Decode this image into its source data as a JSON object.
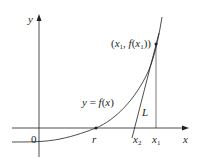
{
  "diagram": {
    "colors": {
      "ink": "#231f20",
      "background": "#ffffff"
    },
    "axes": {
      "x_label": "x",
      "y_label": "y",
      "origin_label": "0"
    },
    "curve_label": "y = f(x)",
    "tangent_label": "L",
    "point_label": "(x₁, f(x₁))",
    "point_label_parts": {
      "open": "(",
      "x": "x",
      "sub1": "1",
      "comma": ", ",
      "f": "f",
      "paren_open": "(",
      "x2": "x",
      "sub2": "1",
      "close": "))"
    },
    "root_label": "r",
    "x2_label": {
      "var": "x",
      "sub": "2"
    },
    "x1_label": {
      "var": "x",
      "sub": "1"
    }
  }
}
